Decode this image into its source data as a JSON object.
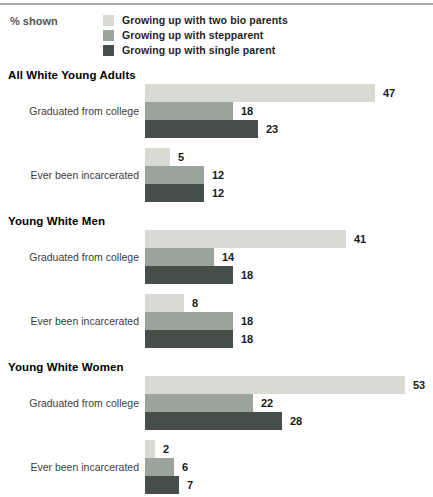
{
  "header": {
    "percent_shown_label": "% shown"
  },
  "legend": {
    "items": [
      {
        "label": "Growing up with two bio parents",
        "color": "#d7dbd4"
      },
      {
        "label": "Growing up with stepparent",
        "color": "#9aa39c"
      },
      {
        "label": "Growing up with single parent",
        "color": "#454e49"
      }
    ]
  },
  "chart_data": {
    "type": "bar",
    "orientation": "horizontal",
    "unit": "percent",
    "xlim": [
      0,
      55
    ],
    "grid": false,
    "legend_position": "top",
    "series_names": [
      "Growing up with two bio parents",
      "Growing up with stepparent",
      "Growing up with single parent"
    ],
    "series_colors": [
      "#d7dbd4",
      "#9aa39c",
      "#454e49"
    ],
    "sections": [
      {
        "title": "All White Young Adults",
        "groups": [
          {
            "label": "Graduated from college",
            "values": [
              47,
              18,
              23
            ]
          },
          {
            "label": "Ever been incarcerated",
            "values": [
              5,
              12,
              12
            ]
          }
        ]
      },
      {
        "title": "Young White Men",
        "groups": [
          {
            "label": "Graduated from college",
            "values": [
              41,
              14,
              18
            ]
          },
          {
            "label": "Ever been incarcerated",
            "values": [
              8,
              18,
              18
            ]
          }
        ]
      },
      {
        "title": "Young White Women",
        "groups": [
          {
            "label": "Graduated from college",
            "values": [
              53,
              22,
              28
            ]
          },
          {
            "label": "Ever been incarcerated",
            "values": [
              2,
              6,
              7
            ]
          }
        ]
      }
    ]
  }
}
